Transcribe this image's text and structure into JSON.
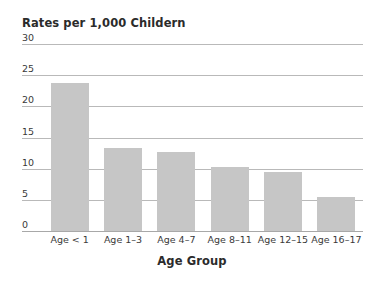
{
  "chart_data": {
    "type": "bar",
    "title": "Rates per 1,000 Childern",
    "xlabel": "Age Group",
    "ylabel": "",
    "categories": [
      "Age < 1",
      "Age 1–3",
      "Age 4–7",
      "Age 8–11",
      "Age 12–15",
      "Age 16–17"
    ],
    "values": [
      23.7,
      13.3,
      12.7,
      10.2,
      9.4,
      5.5
    ],
    "ylim": [
      0,
      30
    ],
    "ytick_labels": [
      "0",
      "5",
      "10",
      "15",
      "20",
      "25",
      "30"
    ],
    "ytick_values": [
      0,
      5,
      10,
      15,
      20,
      25,
      30
    ],
    "grid": true,
    "legend": false,
    "bar_color": "#c6c6c6",
    "gridline_color": "#b9b9b9",
    "text_color": "#2b2b2b",
    "background_color": "#ffffff"
  }
}
